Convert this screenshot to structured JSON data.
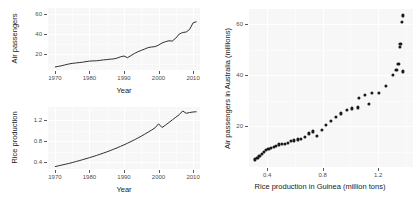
{
  "figure": {
    "background_color": "#ffffff",
    "panel_color": "#f7f7f7",
    "grid_color": "#ffffff",
    "ink_color": "#1a1a1a"
  },
  "chart_data": [
    {
      "id": "air-passengers-timeseries",
      "type": "line",
      "title": "",
      "xlabel": "Year",
      "ylabel": "Air passengers",
      "xlim": [
        1968,
        2012
      ],
      "ylim": [
        4,
        66
      ],
      "xticks": [
        1970,
        1980,
        1990,
        2000,
        2010
      ],
      "xtick_labels": [
        "1970",
        "1980",
        "1990",
        "2000",
        "2010"
      ],
      "yticks": [
        20,
        40,
        60
      ],
      "ytick_labels": [
        "20",
        "40",
        "60"
      ],
      "grid": true,
      "legend": "none",
      "x": [
        1970,
        1971,
        1972,
        1973,
        1974,
        1975,
        1976,
        1977,
        1978,
        1979,
        1980,
        1981,
        1982,
        1983,
        1984,
        1985,
        1986,
        1987,
        1988,
        1989,
        1990,
        1991,
        1992,
        1993,
        1994,
        1995,
        1996,
        1997,
        1998,
        1999,
        2000,
        2001,
        2002,
        2003,
        2004,
        2005,
        2006,
        2007,
        2008,
        2009,
        2010,
        2011
      ],
      "y": [
        7.0,
        7.6,
        8.3,
        9.2,
        10.0,
        10.6,
        11.0,
        11.4,
        11.8,
        12.4,
        12.9,
        13.1,
        13.2,
        13.6,
        14.1,
        14.4,
        14.8,
        15.1,
        15.9,
        17.2,
        18.0,
        16.3,
        18.4,
        20.5,
        22.2,
        23.6,
        25.0,
        26.4,
        27.0,
        27.4,
        28.9,
        31.0,
        32.3,
        33.2,
        33.0,
        35.9,
        40.0,
        41.5,
        42.0,
        44.6,
        51.2,
        52.3,
        61.0,
        63.5
      ]
    },
    {
      "id": "rice-production-timeseries",
      "type": "line",
      "title": "",
      "xlabel": "Year",
      "ylabel": "Rice production",
      "xlim": [
        1968,
        2012
      ],
      "ylim": [
        0.27,
        1.45
      ],
      "xticks": [
        1970,
        1980,
        1990,
        2000,
        2010
      ],
      "xtick_labels": [
        "1970",
        "1980",
        "1990",
        "2000",
        "2010"
      ],
      "yticks": [
        0.4,
        0.8,
        1.2
      ],
      "ytick_labels": [
        "0.4",
        "0.8",
        "1.2"
      ],
      "grid": true,
      "legend": "none",
      "x": [
        1970,
        1971,
        1972,
        1973,
        1974,
        1975,
        1976,
        1977,
        1978,
        1979,
        1980,
        1981,
        1982,
        1983,
        1984,
        1985,
        1986,
        1987,
        1988,
        1989,
        1990,
        1991,
        1992,
        1993,
        1994,
        1995,
        1996,
        1997,
        1998,
        1999,
        2000,
        2001,
        2002,
        2003,
        2004,
        2005,
        2006,
        2007,
        2008,
        2009,
        2010,
        2011
      ],
      "y": [
        0.315,
        0.33,
        0.345,
        0.36,
        0.375,
        0.392,
        0.41,
        0.428,
        0.447,
        0.466,
        0.486,
        0.506,
        0.527,
        0.549,
        0.572,
        0.595,
        0.62,
        0.646,
        0.673,
        0.701,
        0.73,
        0.76,
        0.792,
        0.825,
        0.859,
        0.895,
        0.933,
        0.972,
        1.012,
        1.054,
        1.13,
        1.06,
        1.105,
        1.155,
        1.205,
        1.255,
        1.305,
        1.375,
        1.33,
        1.345,
        1.355,
        1.36
      ]
    },
    {
      "id": "air-passengers-vs-rice-scatter",
      "type": "scatter",
      "title": "",
      "xlabel": "Rice production in Guinea (million tons)",
      "ylabel": "Air passengers in Australia (millions)",
      "xlim": [
        0.27,
        1.45
      ],
      "ylim": [
        4,
        66
      ],
      "xticks": [
        0.4,
        0.8,
        1.2
      ],
      "xtick_labels": [
        "0.4",
        "0.8",
        "1.2"
      ],
      "yticks": [
        20,
        40,
        60
      ],
      "ytick_labels": [
        "20",
        "40",
        "60"
      ],
      "grid": true,
      "legend": "none",
      "points": [
        [
          0.315,
          7.0
        ],
        [
          0.33,
          7.6
        ],
        [
          0.345,
          8.3
        ],
        [
          0.36,
          9.2
        ],
        [
          0.375,
          10.0
        ],
        [
          0.392,
          10.6
        ],
        [
          0.41,
          11.0
        ],
        [
          0.428,
          11.4
        ],
        [
          0.447,
          11.8
        ],
        [
          0.466,
          12.4
        ],
        [
          0.486,
          12.9
        ],
        [
          0.506,
          13.1
        ],
        [
          0.527,
          13.2
        ],
        [
          0.549,
          13.6
        ],
        [
          0.572,
          14.1
        ],
        [
          0.595,
          14.4
        ],
        [
          0.62,
          14.8
        ],
        [
          0.646,
          15.1
        ],
        [
          0.673,
          15.9
        ],
        [
          0.701,
          17.2
        ],
        [
          0.73,
          18.0
        ],
        [
          0.76,
          16.3
        ],
        [
          0.792,
          18.4
        ],
        [
          0.825,
          20.5
        ],
        [
          0.859,
          22.2
        ],
        [
          0.895,
          23.6
        ],
        [
          0.933,
          25.0
        ],
        [
          0.972,
          26.4
        ],
        [
          1.012,
          27.0
        ],
        [
          1.054,
          27.4
        ],
        [
          1.13,
          28.9
        ],
        [
          1.06,
          31.0
        ],
        [
          1.105,
          32.3
        ],
        [
          1.155,
          33.2
        ],
        [
          1.205,
          33.0
        ],
        [
          1.255,
          35.9
        ],
        [
          1.305,
          40.0
        ],
        [
          1.375,
          41.5
        ],
        [
          1.33,
          42.0
        ],
        [
          1.345,
          44.6
        ],
        [
          1.355,
          51.2
        ],
        [
          1.36,
          52.3
        ],
        [
          1.372,
          61.0
        ],
        [
          1.378,
          63.5
        ]
      ]
    }
  ]
}
